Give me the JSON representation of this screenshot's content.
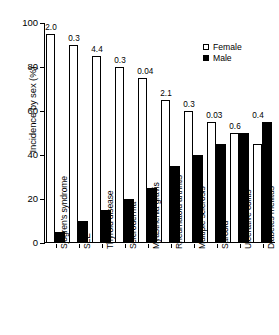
{
  "chart_data": {
    "type": "bar",
    "title": "",
    "xlabel": "",
    "ylabel": "Incidence by sex (%)",
    "ylim": [
      0,
      100
    ],
    "yticks": [
      0,
      20,
      40,
      60,
      80,
      100
    ],
    "ytick_labels": [
      "0",
      "20",
      "40",
      "60",
      "80",
      "100"
    ],
    "grid": false,
    "legend_position": "top-right",
    "categories": [
      "Sjogren's syndrome",
      "SLE",
      "Thyroid disease",
      "Scleroderma",
      "Myasthenia gravis",
      "Rheumatoid arthritis",
      "Multiple sclerosis",
      "Sarcoid",
      "Ulcerative colitis",
      "Diabetes mellitus"
    ],
    "series": [
      {
        "name": "Female",
        "color": "#ffffff",
        "values": [
          95,
          90,
          85,
          80,
          75,
          65,
          60,
          55,
          50,
          45
        ]
      },
      {
        "name": "Male",
        "color": "#000000",
        "values": [
          5,
          10,
          15,
          20,
          25,
          35,
          40,
          45,
          50,
          55
        ]
      }
    ],
    "annotations": [
      "2.0",
      "0.3",
      "4.4",
      "0.3",
      "0.04",
      "2.1",
      "0.3",
      "0.03",
      "0.6",
      "0.4"
    ],
    "annotation_note": "Female:male incidence ratio shown above each group"
  },
  "legend": {
    "items": [
      {
        "label": "Female",
        "marker": "open-square"
      },
      {
        "label": "Male",
        "marker": "filled-square"
      }
    ]
  }
}
